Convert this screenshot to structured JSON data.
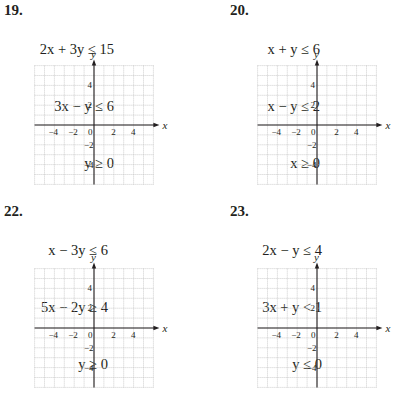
{
  "problems": [
    {
      "number": "19.",
      "inequalities": [
        "2x + 3y ≤ 15",
        "3x − y ≤ 6",
        "y ≥ 0"
      ],
      "graph": {
        "x_label": "x",
        "y_label": "y",
        "x_ticks": [
          "−4",
          "−2",
          "0",
          "2",
          "4"
        ],
        "y_ticks": [
          "4",
          "2",
          "−2",
          "−4"
        ]
      }
    },
    {
      "number": "20.",
      "inequalities": [
        "x + y ≤ 6",
        "x − y ≤ 2",
        "x ≥ 0"
      ],
      "graph": {
        "x_label": "x",
        "y_label": "y",
        "x_ticks": [
          "−4",
          "−2",
          "0",
          "2",
          "4"
        ],
        "y_ticks": [
          "4",
          "2",
          "−2",
          "−4"
        ]
      }
    },
    {
      "number": "22.",
      "inequalities": [
        "x − 3y ≤ 6",
        "5x − 2y ≥ 4",
        "y ≥ 0"
      ],
      "graph": {
        "x_label": "x",
        "y_label": "y",
        "x_ticks": [
          "−4",
          "−2",
          "0",
          "2",
          "4"
        ],
        "y_ticks": [
          "4",
          "2",
          "−2",
          "−4"
        ]
      }
    },
    {
      "number": "23.",
      "inequalities": [
        "2x − y ≤ 4",
        "3x + y < 1",
        "y ≤ 0"
      ],
      "graph": {
        "x_label": "x",
        "y_label": "y",
        "x_ticks": [
          "−4",
          "−2",
          "0",
          "2",
          "4"
        ],
        "y_ticks": [
          "4",
          "2",
          "−2",
          "−4"
        ]
      }
    }
  ],
  "colors": {
    "grid": "#b8b8b8",
    "axis": "#231f20",
    "text": "#231f20"
  }
}
